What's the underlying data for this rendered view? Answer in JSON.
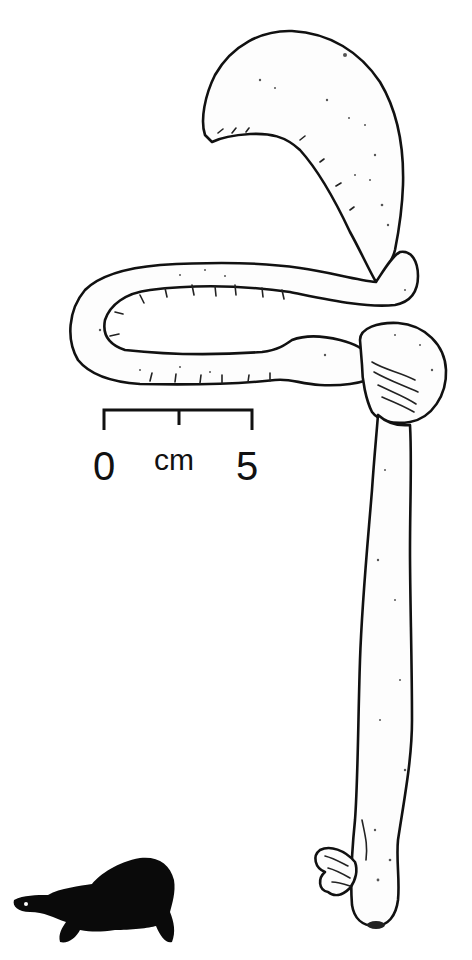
{
  "figure": {
    "colors": {
      "line": "#111111",
      "fill": "#fdfdfd",
      "silhouette": "#0a0a0a",
      "background": "#ffffff"
    }
  },
  "scale_bar": {
    "start_label": "0",
    "unit_label": "cm",
    "end_label": "5"
  },
  "parts": [
    {
      "id": "stomach",
      "name": "stomach"
    },
    {
      "id": "small-intestine",
      "name": "small intestine"
    },
    {
      "id": "caecum",
      "name": "caecum"
    },
    {
      "id": "large-intestine",
      "name": "large intestine"
    },
    {
      "id": "cloaca",
      "name": "cloaca"
    },
    {
      "id": "bladder",
      "name": "accessory bladder"
    }
  ],
  "icon": {
    "name": "turtle-silhouette"
  }
}
